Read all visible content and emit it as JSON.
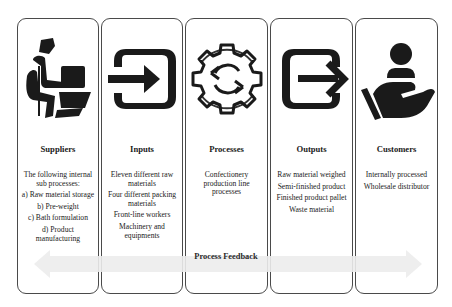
{
  "columns": [
    {
      "title": "Suppliers",
      "icon": "worker-carrying-boxes-icon",
      "items": [
        "The following internal sub processes:",
        "a) Raw material storage",
        "b) Pre-weight",
        "c) Bath formulation",
        "d) Product manufacturing"
      ]
    },
    {
      "title": "Inputs",
      "icon": "sign-in-arrow-icon",
      "items": [
        "Eleven different raw materials",
        "Four different packing materials",
        "Front-line workers",
        "Machinery and equipments"
      ]
    },
    {
      "title": "Processes",
      "icon": "gear-cycle-icon",
      "items": [
        "Confectionery production line processes"
      ]
    },
    {
      "title": "Outputs",
      "icon": "sign-out-arrow-icon",
      "items": [
        "Raw material weighed",
        "Semi-finished product",
        "Finished product pallet",
        "Waste material"
      ]
    },
    {
      "title": "Customers",
      "icon": "hand-holding-person-icon",
      "items": [
        "Internally processed",
        "Wholesale distributor"
      ]
    }
  ],
  "feedback": {
    "label": "Process Feedback",
    "arrow_color": "#e8e8e8"
  }
}
